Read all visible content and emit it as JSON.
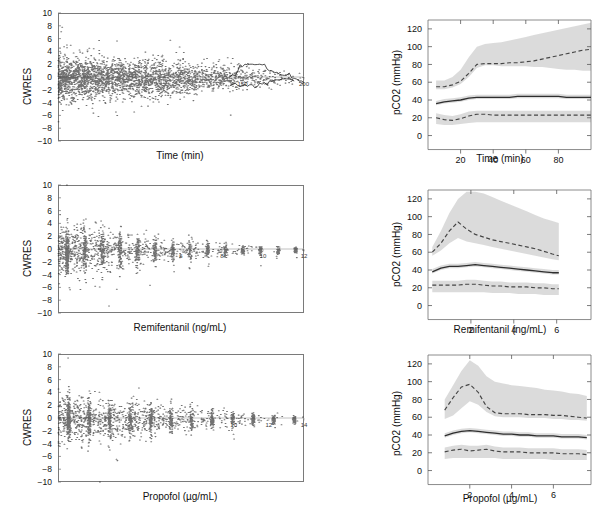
{
  "figure": {
    "panel_count": 6,
    "colors": {
      "scatter": "#1a1a1a",
      "band": "#d9d9d9",
      "median_line": "#3c3c3c",
      "percentile_line": "#4a4a4a",
      "axis": "#6f6f6f",
      "background": "#ffffff"
    }
  },
  "chart_data": [
    {
      "id": "cwres-time",
      "type": "scatter",
      "title": "",
      "xlabel": "Time (min)",
      "ylabel": "CWRES",
      "xlim": [
        0,
        200
      ],
      "ylim": [
        -10,
        10
      ],
      "yticks": [
        -10,
        -8,
        -6,
        -4,
        -2,
        0,
        2,
        4,
        6,
        8,
        10
      ],
      "xticks": [
        150,
        200
      ],
      "xticklabels": [
        "150",
        "200"
      ],
      "grid": false,
      "legend": "none",
      "n_points": 4000,
      "notes": "Dense residual cloud, heaviest mass between 0 and 100 min, funnel narrowing toward right"
    },
    {
      "id": "pco2-time",
      "type": "line",
      "title": "",
      "xlabel": "Time (min)",
      "ylabel": "pCO2 (mmHg)",
      "xlim": [
        0,
        100
      ],
      "ylim": [
        -5,
        130
      ],
      "yticks": [
        0,
        20,
        40,
        60,
        80,
        100,
        120
      ],
      "xticks": [
        20,
        40,
        60,
        80
      ],
      "xticklabels": [
        "20",
        "40",
        "60",
        "80"
      ],
      "grid": false,
      "legend": "none",
      "x": [
        5,
        10,
        15,
        20,
        25,
        30,
        35,
        40,
        45,
        50,
        55,
        60,
        65,
        70,
        75,
        80,
        85,
        90,
        95,
        100
      ],
      "series": [
        {
          "name": "95th percentile",
          "style": "dashed",
          "values": [
            55,
            55,
            57,
            61,
            70,
            80,
            81,
            81,
            81,
            82,
            82,
            83,
            84,
            86,
            88,
            90,
            92,
            94,
            96,
            97
          ]
        },
        {
          "name": "median",
          "style": "solid",
          "values": [
            36,
            38,
            39,
            40,
            42,
            43,
            43,
            43,
            43,
            43,
            44,
            44,
            44,
            44,
            44,
            44,
            43,
            43,
            43,
            43
          ]
        },
        {
          "name": "5th percentile",
          "style": "dashed",
          "values": [
            20,
            18,
            17,
            19,
            22,
            24,
            24,
            23,
            23,
            23,
            23,
            23,
            23,
            23,
            23,
            23,
            23,
            23,
            23,
            23
          ]
        }
      ],
      "bands": [
        {
          "name": "95th percentile CI",
          "lower": [
            52,
            52,
            54,
            58,
            66,
            76,
            79,
            79,
            78,
            78,
            78,
            78,
            77,
            77,
            76,
            75,
            74,
            74,
            73,
            73
          ],
          "upper": [
            62,
            62,
            66,
            74,
            88,
            100,
            103,
            104,
            105,
            107,
            109,
            111,
            113,
            115,
            117,
            119,
            121,
            123,
            125,
            127
          ]
        },
        {
          "name": "median CI",
          "lower": [
            34,
            36,
            37,
            38,
            40,
            41,
            41,
            41,
            41,
            41,
            42,
            42,
            42,
            42,
            42,
            42,
            41,
            41,
            41,
            41
          ],
          "upper": [
            39,
            41,
            42,
            43,
            45,
            46,
            46,
            46,
            46,
            46,
            47,
            47,
            47,
            47,
            47,
            47,
            46,
            46,
            46,
            46
          ]
        },
        {
          "name": "5th percentile CI",
          "lower": [
            13,
            12,
            12,
            13,
            14,
            15,
            15,
            15,
            15,
            15,
            15,
            15,
            15,
            15,
            15,
            15,
            15,
            15,
            15,
            15
          ],
          "upper": [
            25,
            23,
            22,
            24,
            27,
            28,
            28,
            28,
            28,
            28,
            28,
            28,
            28,
            28,
            28,
            28,
            28,
            28,
            28,
            28
          ]
        }
      ]
    },
    {
      "id": "cwres-remifentanil",
      "type": "scatter",
      "title": "",
      "xlabel": "Remifentanil (ng/mL)",
      "ylabel": "CWRES",
      "xlim": [
        0,
        12
      ],
      "ylim": [
        -10,
        10
      ],
      "yticks": [
        -10,
        -8,
        -6,
        -4,
        -2,
        0,
        2,
        4,
        6,
        8,
        10
      ],
      "xticks": [
        6,
        8,
        10,
        12
      ],
      "xticklabels": [
        "6",
        "8",
        "10",
        "12"
      ],
      "grid": false,
      "legend": "none",
      "n_points": 3500,
      "notes": "Vertical striping from repeated concentration values; spread greatest below 3 ng/mL"
    },
    {
      "id": "pco2-remifentanil",
      "type": "line",
      "title": "",
      "xlabel": "Remifentanil (ng/mL)",
      "ylabel": "pCO2 (mmHg)",
      "xlim": [
        0,
        7.6
      ],
      "ylim": [
        -5,
        130
      ],
      "yticks": [
        0,
        20,
        40,
        60,
        80,
        100,
        120
      ],
      "xticks": [
        2,
        4,
        6
      ],
      "xticklabels": [
        "2",
        "4",
        "6"
      ],
      "grid": false,
      "legend": "none",
      "x": [
        0.2,
        0.6,
        1.0,
        1.4,
        1.8,
        2.2,
        2.6,
        3.0,
        3.4,
        3.8,
        4.2,
        4.6,
        5.0,
        5.4,
        5.8,
        6.1
      ],
      "series": [
        {
          "name": "95th percentile",
          "style": "dashed",
          "values": [
            60,
            70,
            84,
            94,
            86,
            80,
            77,
            74,
            72,
            70,
            68,
            66,
            64,
            61,
            58,
            56
          ]
        },
        {
          "name": "median",
          "style": "solid",
          "values": [
            38,
            42,
            44,
            44,
            45,
            46,
            45,
            44,
            43,
            42,
            41,
            40,
            39,
            38,
            37,
            37
          ]
        },
        {
          "name": "5th percentile",
          "style": "dashed",
          "values": [
            23,
            23,
            23,
            23,
            24,
            24,
            23,
            22,
            22,
            21,
            21,
            21,
            20,
            20,
            19,
            19
          ]
        }
      ],
      "bands": [
        {
          "name": "95th percentile CI",
          "lower": [
            56,
            62,
            70,
            76,
            72,
            70,
            68,
            66,
            64,
            62,
            60,
            58,
            56,
            54,
            52,
            51
          ],
          "upper": [
            66,
            84,
            104,
            120,
            128,
            128,
            126,
            122,
            118,
            114,
            110,
            106,
            102,
            98,
            95,
            93
          ]
        },
        {
          "name": "median CI",
          "lower": [
            36,
            40,
            42,
            42,
            43,
            44,
            43,
            42,
            41,
            40,
            39,
            38,
            37,
            36,
            35,
            35
          ],
          "upper": [
            41,
            45,
            47,
            47,
            48,
            49,
            48,
            47,
            46,
            45,
            44,
            43,
            42,
            41,
            40,
            40
          ]
        },
        {
          "name": "5th percentile CI",
          "lower": [
            15,
            15,
            15,
            15,
            15,
            15,
            15,
            14,
            14,
            14,
            13,
            13,
            13,
            12,
            12,
            12
          ],
          "upper": [
            28,
            28,
            28,
            28,
            29,
            29,
            28,
            27,
            27,
            26,
            26,
            26,
            25,
            25,
            24,
            24
          ]
        }
      ]
    },
    {
      "id": "cwres-propofol",
      "type": "scatter",
      "title": "",
      "xlabel": "Propofol (µg/mL)",
      "ylabel": "CWRES",
      "xlim": [
        0,
        14
      ],
      "ylim": [
        -10,
        10
      ],
      "yticks": [
        -10,
        -8,
        -6,
        -4,
        -2,
        0,
        2,
        4,
        6,
        8,
        10
      ],
      "xticks": [
        10,
        12,
        14
      ],
      "xticklabels": [
        "10",
        "12",
        "14"
      ],
      "grid": false,
      "legend": "none",
      "n_points": 3500,
      "notes": "Vertical striping at discrete propofol concentrations; widest dispersion below 5 µg/mL"
    },
    {
      "id": "pco2-propofol",
      "type": "line",
      "title": "",
      "xlabel": "Propofol (µg/mL)",
      "ylabel": "pCO2 (mmHg)",
      "xlim": [
        0,
        7.8
      ],
      "ylim": [
        -5,
        130
      ],
      "yticks": [
        0,
        20,
        40,
        60,
        80,
        100,
        120
      ],
      "xticks": [
        2,
        4,
        6
      ],
      "xticklabels": [
        "2",
        "4",
        "6"
      ],
      "grid": false,
      "legend": "none",
      "x": [
        0.8,
        1.2,
        1.6,
        2.0,
        2.4,
        2.8,
        3.2,
        3.6,
        4.0,
        4.4,
        4.8,
        5.2,
        5.6,
        6.0,
        6.4,
        6.8,
        7.2,
        7.6
      ],
      "series": [
        {
          "name": "95th percentile",
          "style": "dashed",
          "values": [
            68,
            82,
            94,
            97,
            88,
            72,
            65,
            64,
            64,
            64,
            63,
            63,
            63,
            62,
            62,
            61,
            60,
            59
          ]
        },
        {
          "name": "median",
          "style": "solid",
          "values": [
            39,
            42,
            44,
            45,
            44,
            43,
            42,
            41,
            41,
            40,
            40,
            39,
            39,
            39,
            38,
            38,
            38,
            37
          ]
        },
        {
          "name": "5th percentile",
          "style": "dashed",
          "values": [
            21,
            23,
            24,
            22,
            23,
            24,
            22,
            21,
            21,
            21,
            20,
            20,
            20,
            20,
            19,
            19,
            19,
            18
          ]
        }
      ],
      "bands": [
        {
          "name": "95th percentile CI",
          "lower": [
            58,
            62,
            70,
            78,
            74,
            66,
            61,
            60,
            60,
            60,
            59,
            59,
            59,
            58,
            58,
            57,
            57,
            56
          ],
          "upper": [
            80,
            96,
            112,
            124,
            118,
            106,
            100,
            98,
            96,
            95,
            94,
            93,
            91,
            90,
            89,
            87,
            86,
            84
          ]
        },
        {
          "name": "median CI",
          "lower": [
            37,
            40,
            42,
            43,
            42,
            41,
            40,
            39,
            39,
            38,
            38,
            37,
            37,
            37,
            36,
            36,
            36,
            35
          ],
          "upper": [
            42,
            45,
            47,
            48,
            47,
            46,
            45,
            44,
            44,
            43,
            43,
            42,
            42,
            42,
            41,
            41,
            41,
            40
          ]
        },
        {
          "name": "5th percentile CI",
          "lower": [
            13,
            14,
            14,
            14,
            14,
            14,
            14,
            13,
            13,
            13,
            13,
            13,
            13,
            12,
            12,
            12,
            12,
            12
          ],
          "upper": [
            26,
            28,
            29,
            28,
            28,
            29,
            27,
            26,
            26,
            26,
            25,
            25,
            25,
            25,
            24,
            24,
            24,
            23
          ]
        }
      ]
    }
  ]
}
